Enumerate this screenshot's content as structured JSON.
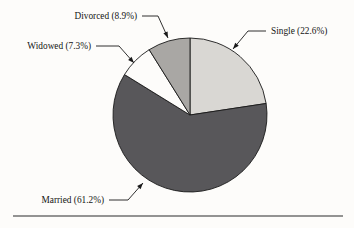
{
  "figure": {
    "background_color": "#fdfcfa",
    "rule": {
      "name": "bottom-horizontal-rule",
      "x1": 13,
      "x2": 343,
      "y": 216,
      "color": "#2a2a2a"
    }
  },
  "chart_data": {
    "type": "pie",
    "title": "",
    "subtitle": "",
    "xlabel": "",
    "ylabel": "",
    "grid": false,
    "legend_position": "none",
    "label_style": "callout-leader-lines",
    "start_angle_deg": -90,
    "direction": "clockwise",
    "center": {
      "x": 190,
      "y": 115
    },
    "radius": 77,
    "categories": [
      "Single",
      "Married",
      "Widowed",
      "Divorced"
    ],
    "values": [
      22.6,
      61.2,
      7.3,
      8.9
    ],
    "units": "percent",
    "total": 100.0,
    "slices": [
      {
        "name": "Single",
        "label": "Single (22.6%)",
        "value": 22.6,
        "percent_text": "22.6%",
        "color": "#d9d7d3",
        "start_deg": -90.0,
        "end_deg": -8.6,
        "sweep_deg": 81.4,
        "label_x": 271,
        "label_y": 34,
        "label_anchor": "start",
        "leader": [
          [
            266,
            31
          ],
          [
            248,
            31
          ],
          [
            233,
            49
          ]
        ],
        "arrow_at": [
          233,
          49
        ],
        "arrow_dir_deg": 130
      },
      {
        "name": "Married",
        "label": "Married (61.2%)",
        "value": 61.2,
        "percent_text": "61.2%",
        "color": "#58575a",
        "start_deg": -8.6,
        "end_deg": 211.7,
        "sweep_deg": 220.3,
        "label_x": 104,
        "label_y": 203,
        "label_anchor": "end",
        "leader": [
          [
            109,
            200
          ],
          [
            128,
            200
          ],
          [
            143,
            183
          ]
        ],
        "arrow_at": [
          143,
          183
        ],
        "arrow_dir_deg": -48
      },
      {
        "name": "Widowed",
        "label": "Widowed (7.3%)",
        "value": 7.3,
        "percent_text": "7.3%",
        "color": "#fdfcfa",
        "start_deg": 211.7,
        "end_deg": 238.0,
        "sweep_deg": 26.3,
        "label_x": 91,
        "label_y": 49,
        "label_anchor": "end",
        "leader": [
          [
            96,
            46
          ],
          [
            119,
            46
          ],
          [
            134,
            63
          ]
        ],
        "arrow_at": [
          134,
          63
        ],
        "arrow_dir_deg": 48
      },
      {
        "name": "Divorced",
        "label": "Divorced (8.9%)",
        "value": 8.9,
        "percent_text": "8.9%",
        "color": "#a9a7a4",
        "start_deg": 238.0,
        "end_deg": 270.0,
        "sweep_deg": 32.0,
        "label_x": 137,
        "label_y": 19,
        "label_anchor": "end",
        "leader": [
          [
            142,
            16
          ],
          [
            158,
            16
          ],
          [
            168,
            38
          ]
        ],
        "arrow_at": [
          168,
          38
        ],
        "arrow_dir_deg": 66
      }
    ]
  }
}
